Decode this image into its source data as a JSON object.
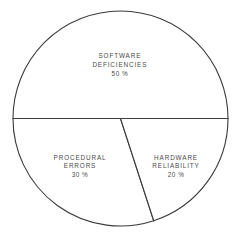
{
  "chart_data": {
    "type": "pie",
    "title": "",
    "subtitle": "",
    "xlabel": "",
    "ylabel": "",
    "legend": "none",
    "grid": false,
    "units": "percent",
    "total": 100,
    "start_angle_deg": 180,
    "direction": "clockwise",
    "categories": [
      "SOFTWARE DEFICIENCIES",
      "PROCEDURAL ERRORS",
      "HARDWARE RELIABILITY"
    ],
    "values": [
      50,
      30,
      20
    ],
    "slices": [
      {
        "name": "software-deficiencies",
        "label_line1": "SOFTWARE",
        "label_line2": "DEFICIENCIES",
        "value": 50,
        "value_label": "50 %",
        "sweep_deg": 180,
        "start_deg": 180,
        "end_deg": 360,
        "fill": "#ffffff",
        "stroke": "#3a3a3a",
        "label_x_pct": 50.8,
        "label_y_pct": 27.0
      },
      {
        "name": "procedural-errors",
        "label_line1": "PROCEDURAL",
        "label_line2": "ERRORS",
        "value": 30,
        "value_label": "30 %",
        "sweep_deg": 108,
        "start_deg": 72,
        "end_deg": 180,
        "fill": "#ffffff",
        "stroke": "#3a3a3a",
        "label_x_pct": 33.9,
        "label_y_pct": 69.2
      },
      {
        "name": "hardware-reliability",
        "label_line1": "HARDWARE",
        "label_line2": "RELIABILITY",
        "value": 20,
        "value_label": "20 %",
        "sweep_deg": 72,
        "start_deg": 0,
        "end_deg": 72,
        "fill": "#ffffff",
        "stroke": "#3a3a3a",
        "label_x_pct": 74.6,
        "label_y_pct": 69.2
      }
    ],
    "geometry": {
      "center_x": 120.5,
      "center_y": 118.5,
      "radius": 107.5
    }
  }
}
